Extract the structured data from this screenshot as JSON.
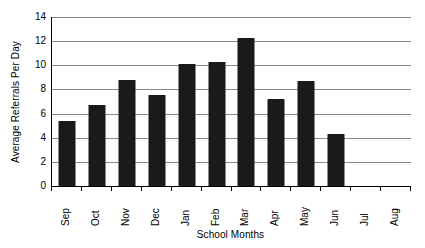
{
  "chart_data": {
    "type": "bar",
    "title": "",
    "xlabel": "School Months",
    "ylabel": "Average Referrals Per Day",
    "categories": [
      "Sep",
      "Oct",
      "Nov",
      "Dec",
      "Jan",
      "Feb",
      "Mar",
      "Apr",
      "May",
      "Jun",
      "Jul",
      "Aug"
    ],
    "values": [
      5.4,
      6.7,
      8.75,
      7.55,
      10.1,
      10.3,
      12.25,
      7.2,
      8.7,
      4.3,
      0,
      0
    ],
    "series": [
      {
        "name": "Average Referrals Per Day",
        "values": [
          5.4,
          6.7,
          8.75,
          7.55,
          10.1,
          10.3,
          12.25,
          7.2,
          8.7,
          4.3,
          0,
          0
        ]
      }
    ],
    "ylim": [
      0,
      14
    ],
    "yticks": [
      0,
      2,
      4,
      6,
      8,
      10,
      12,
      14
    ],
    "ytick_labels": [
      "0",
      "2",
      "4",
      "6",
      "8",
      "10",
      "12",
      "14"
    ],
    "grid": "horizontal",
    "legend": "none",
    "bar_color": "#1a1a1a",
    "gridline_color": "#8b8b8b",
    "axis_color": "#000000",
    "background_color": "#ffffff"
  }
}
